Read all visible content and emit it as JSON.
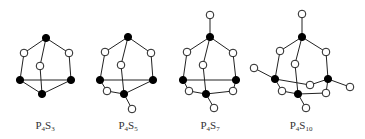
{
  "molecules": [
    {
      "name": "P4S3",
      "label": {
        "el1": "P",
        "n1": "4",
        "el2": "S",
        "n2": "3",
        "x": 45
      },
      "atoms": [
        {
          "id": "Pt",
          "type": "P",
          "x": 46,
          "y": 38
        },
        {
          "id": "Sl",
          "type": "S",
          "x": 24,
          "y": 53
        },
        {
          "id": "Sr",
          "type": "S",
          "x": 69,
          "y": 53
        },
        {
          "id": "Sc",
          "type": "S",
          "x": 40,
          "y": 66
        },
        {
          "id": "Pl",
          "type": "P",
          "x": 20,
          "y": 80
        },
        {
          "id": "Pr",
          "type": "P",
          "x": 71,
          "y": 80
        },
        {
          "id": "Pb",
          "type": "P",
          "x": 42,
          "y": 94
        }
      ],
      "bonds": [
        [
          "Pt",
          "Sl"
        ],
        [
          "Pt",
          "Sr"
        ],
        [
          "Pt",
          "Sc"
        ],
        [
          "Sl",
          "Pl"
        ],
        [
          "Sr",
          "Pr"
        ],
        [
          "Sc",
          "Pb"
        ],
        [
          "Pl",
          "Pr"
        ],
        [
          "Pl",
          "Pb"
        ],
        [
          "Pr",
          "Pb"
        ]
      ]
    },
    {
      "name": "P4S5",
      "label": {
        "el1": "P",
        "n1": "4",
        "el2": "S",
        "n2": "5",
        "x": 128
      },
      "atoms": [
        {
          "id": "Pt",
          "type": "P",
          "x": 128,
          "y": 37
        },
        {
          "id": "Sl",
          "type": "S",
          "x": 105,
          "y": 52
        },
        {
          "id": "Sr",
          "type": "S",
          "x": 151,
          "y": 53
        },
        {
          "id": "Sc",
          "type": "S",
          "x": 121,
          "y": 65
        },
        {
          "id": "Pl",
          "type": "P",
          "x": 100,
          "y": 80
        },
        {
          "id": "Pr",
          "type": "P",
          "x": 153,
          "y": 80
        },
        {
          "id": "Sll",
          "type": "S",
          "x": 107,
          "y": 91
        },
        {
          "id": "Pb",
          "type": "P",
          "x": 124,
          "y": 94
        },
        {
          "id": "Sb",
          "type": "S",
          "x": 132,
          "y": 109
        }
      ],
      "bonds": [
        [
          "Pt",
          "Sl"
        ],
        [
          "Pt",
          "Sr"
        ],
        [
          "Pt",
          "Sc"
        ],
        [
          "Sl",
          "Pl"
        ],
        [
          "Sr",
          "Pr"
        ],
        [
          "Sc",
          "Pb"
        ],
        [
          "Pl",
          "Pr"
        ],
        [
          "Pl",
          "Sll"
        ],
        [
          "Sll",
          "Pb"
        ],
        [
          "Pr",
          "Pb"
        ],
        [
          "Pb",
          "Sb"
        ]
      ]
    },
    {
      "name": "P4S7",
      "label": {
        "el1": "P",
        "n1": "4",
        "el2": "S",
        "n2": "7",
        "x": 210
      },
      "atoms": [
        {
          "id": "St",
          "type": "S",
          "x": 210,
          "y": 15
        },
        {
          "id": "Pt",
          "type": "P",
          "x": 210,
          "y": 37
        },
        {
          "id": "Sl",
          "type": "S",
          "x": 187,
          "y": 52
        },
        {
          "id": "Sr",
          "type": "S",
          "x": 233,
          "y": 53
        },
        {
          "id": "Sc",
          "type": "S",
          "x": 203,
          "y": 65
        },
        {
          "id": "Pl",
          "type": "P",
          "x": 183,
          "y": 80
        },
        {
          "id": "Pr",
          "type": "P",
          "x": 236,
          "y": 80
        },
        {
          "id": "Sll",
          "type": "S",
          "x": 189,
          "y": 91
        },
        {
          "id": "Pb",
          "type": "P",
          "x": 206,
          "y": 94
        },
        {
          "id": "Slr",
          "type": "S",
          "x": 233,
          "y": 91
        },
        {
          "id": "Sb",
          "type": "S",
          "x": 214,
          "y": 108
        }
      ],
      "bonds": [
        [
          "St",
          "Pt"
        ],
        [
          "Pt",
          "Sl"
        ],
        [
          "Pt",
          "Sr"
        ],
        [
          "Pt",
          "Sc"
        ],
        [
          "Sl",
          "Pl"
        ],
        [
          "Sr",
          "Pr"
        ],
        [
          "Sc",
          "Pb"
        ],
        [
          "Pl",
          "Pr"
        ],
        [
          "Pl",
          "Sll"
        ],
        [
          "Sll",
          "Pb"
        ],
        [
          "Pb",
          "Slr"
        ],
        [
          "Slr",
          "Pr"
        ],
        [
          "Pb",
          "Sb"
        ]
      ]
    },
    {
      "name": "P4S10",
      "label": {
        "el1": "P",
        "n1": "4",
        "el2": "S",
        "n2": "10",
        "x": 301
      },
      "atoms": [
        {
          "id": "St",
          "type": "S",
          "x": 302,
          "y": 14
        },
        {
          "id": "Pt",
          "type": "P",
          "x": 302,
          "y": 37
        },
        {
          "id": "Sl",
          "type": "S",
          "x": 280,
          "y": 51
        },
        {
          "id": "Sr",
          "type": "S",
          "x": 326,
          "y": 52
        },
        {
          "id": "Sc",
          "type": "S",
          "x": 295,
          "y": 64
        },
        {
          "id": "Sfl",
          "type": "S",
          "x": 254,
          "y": 68
        },
        {
          "id": "Pl",
          "type": "P",
          "x": 275,
          "y": 79
        },
        {
          "id": "Pr",
          "type": "P",
          "x": 328,
          "y": 79
        },
        {
          "id": "Sm",
          "type": "S",
          "x": 310,
          "y": 85
        },
        {
          "id": "Sfr",
          "type": "S",
          "x": 350,
          "y": 87
        },
        {
          "id": "Sll",
          "type": "S",
          "x": 282,
          "y": 91
        },
        {
          "id": "Pb",
          "type": "P",
          "x": 298,
          "y": 94
        },
        {
          "id": "Slr",
          "type": "S",
          "x": 326,
          "y": 93
        },
        {
          "id": "Sb",
          "type": "S",
          "x": 306,
          "y": 108
        }
      ],
      "bonds": [
        [
          "St",
          "Pt"
        ],
        [
          "Pt",
          "Sl"
        ],
        [
          "Pt",
          "Sr"
        ],
        [
          "Pt",
          "Sc"
        ],
        [
          "Sl",
          "Pl"
        ],
        [
          "Sr",
          "Pr"
        ],
        [
          "Sc",
          "Pb"
        ],
        [
          "Sfl",
          "Pl"
        ],
        [
          "Pl",
          "Sm"
        ],
        [
          "Sm",
          "Pr"
        ],
        [
          "Pr",
          "Sfr"
        ],
        [
          "Pl",
          "Sll"
        ],
        [
          "Sll",
          "Pb"
        ],
        [
          "Pb",
          "Slr"
        ],
        [
          "Slr",
          "Pr"
        ],
        [
          "Pb",
          "Sb"
        ]
      ]
    }
  ],
  "legend": {
    "filled_atom": "P",
    "open_atom": "S"
  },
  "colors": {
    "bond": "#222222",
    "phosphorus": "#000000",
    "sulfur_fill": "#ffffff"
  }
}
